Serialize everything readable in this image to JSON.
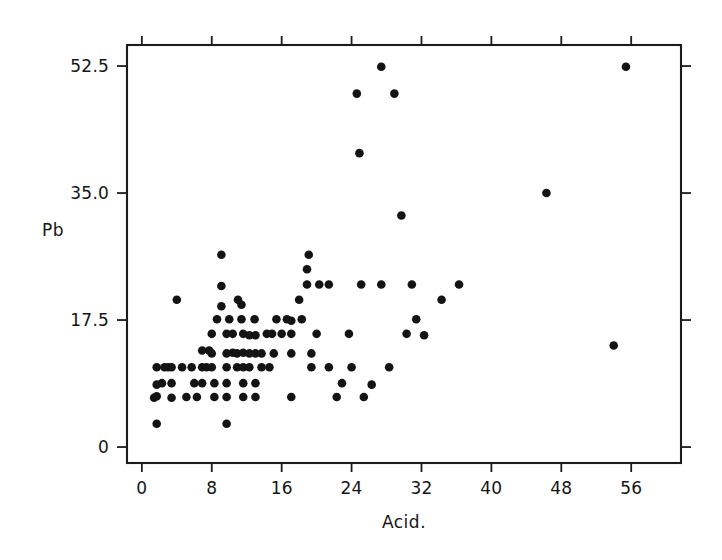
{
  "chart_data": {
    "type": "scatter",
    "title": "",
    "xlabel": "Acid.",
    "ylabel": "Pb",
    "xlim": [
      -1.7,
      61.7
    ],
    "ylim": [
      -2.2,
      55.4
    ],
    "grid": false,
    "legend": null,
    "marker": "filled-circle",
    "marker_color": "#141414",
    "xticks": [
      0,
      8,
      16,
      24,
      32,
      40,
      48,
      56
    ],
    "xtick_labels": [
      "0",
      "8",
      "16",
      "24",
      "32",
      "40",
      "48",
      "56"
    ],
    "yticks": [
      0,
      17.5,
      35.0,
      52.5
    ],
    "ytick_labels": [
      "0",
      "17.5",
      "35.0",
      "52.5"
    ],
    "n_points": 104,
    "points": [
      [
        1.7,
        3.2
      ],
      [
        1.7,
        7.0
      ],
      [
        1.7,
        8.6
      ],
      [
        1.7,
        11.0
      ],
      [
        2.6,
        11.0
      ],
      [
        1.4,
        6.8
      ],
      [
        3.4,
        6.8
      ],
      [
        3.4,
        8.8
      ],
      [
        3.4,
        11.0
      ],
      [
        4.6,
        11.0
      ],
      [
        4.0,
        20.3
      ],
      [
        5.1,
        6.9
      ],
      [
        6.3,
        6.9
      ],
      [
        6.9,
        8.8
      ],
      [
        6.9,
        11.0
      ],
      [
        6.9,
        13.3
      ],
      [
        7.7,
        13.3
      ],
      [
        8.0,
        11.0
      ],
      [
        8.0,
        12.9
      ],
      [
        8.0,
        15.6
      ],
      [
        8.3,
        6.9
      ],
      [
        8.3,
        8.8
      ],
      [
        8.6,
        17.6
      ],
      [
        9.1,
        19.4
      ],
      [
        9.1,
        22.2
      ],
      [
        9.1,
        26.5
      ],
      [
        9.7,
        6.9
      ],
      [
        9.7,
        8.8
      ],
      [
        9.7,
        11.0
      ],
      [
        9.7,
        12.9
      ],
      [
        9.7,
        15.6
      ],
      [
        9.7,
        3.2
      ],
      [
        10.4,
        13.0
      ],
      [
        10.4,
        15.6
      ],
      [
        10.9,
        11.0
      ],
      [
        10.9,
        12.9
      ],
      [
        11.4,
        17.6
      ],
      [
        11.4,
        19.6
      ],
      [
        11.6,
        6.9
      ],
      [
        11.6,
        8.8
      ],
      [
        11.6,
        11.0
      ],
      [
        11.6,
        13.0
      ],
      [
        11.6,
        15.6
      ],
      [
        12.3,
        11.0
      ],
      [
        12.3,
        12.9
      ],
      [
        12.3,
        15.4
      ],
      [
        13.0,
        6.9
      ],
      [
        13.0,
        8.8
      ],
      [
        13.0,
        12.9
      ],
      [
        13.0,
        15.4
      ],
      [
        13.7,
        11.0
      ],
      [
        13.7,
        12.9
      ],
      [
        14.3,
        15.6
      ],
      [
        14.9,
        15.6
      ],
      [
        15.1,
        12.9
      ],
      [
        15.4,
        17.6
      ],
      [
        16.0,
        15.6
      ],
      [
        16.6,
        17.6
      ],
      [
        17.1,
        15.6
      ],
      [
        17.1,
        17.4
      ],
      [
        17.1,
        12.9
      ],
      [
        17.1,
        6.9
      ],
      [
        18.0,
        20.3
      ],
      [
        18.9,
        22.4
      ],
      [
        18.9,
        24.5
      ],
      [
        19.1,
        26.5
      ],
      [
        19.4,
        12.9
      ],
      [
        19.4,
        11.0
      ],
      [
        20.3,
        22.4
      ],
      [
        21.4,
        22.4
      ],
      [
        21.4,
        11.0
      ],
      [
        22.3,
        6.9
      ],
      [
        22.9,
        8.8
      ],
      [
        23.7,
        15.6
      ],
      [
        24.6,
        48.7
      ],
      [
        24.9,
        40.5
      ],
      [
        25.1,
        22.4
      ],
      [
        25.4,
        6.9
      ],
      [
        26.3,
        8.6
      ],
      [
        27.4,
        52.4
      ],
      [
        27.4,
        22.4
      ],
      [
        28.9,
        48.7
      ],
      [
        29.7,
        31.9
      ],
      [
        30.3,
        15.6
      ],
      [
        30.9,
        22.4
      ],
      [
        31.4,
        17.6
      ],
      [
        32.3,
        15.4
      ],
      [
        34.3,
        20.3
      ],
      [
        36.3,
        22.4
      ],
      [
        46.3,
        35.0
      ],
      [
        54.0,
        14.0
      ],
      [
        55.4,
        52.4
      ],
      [
        2.3,
        8.8
      ],
      [
        5.7,
        11.0
      ],
      [
        7.4,
        11.0
      ],
      [
        10.0,
        17.6
      ],
      [
        12.9,
        17.6
      ],
      [
        14.6,
        11.0
      ],
      [
        20.0,
        15.6
      ],
      [
        24.0,
        11.0
      ],
      [
        28.3,
        11.0
      ],
      [
        11.0,
        20.3
      ],
      [
        6.0,
        8.8
      ],
      [
        3.0,
        11.0
      ],
      [
        18.3,
        17.6
      ]
    ]
  },
  "axes": {
    "x_axis_label": "Acid.",
    "y_axis_label": "Pb"
  }
}
